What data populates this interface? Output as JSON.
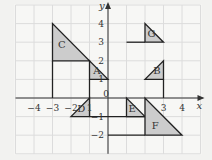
{
  "diagram": {
    "axes": {
      "x_label": "x",
      "y_label": "y",
      "x_range": [
        -5,
        5
      ],
      "y_range": [
        -3,
        5
      ],
      "x_ticks": [
        {
          "v": -4,
          "label": "−4"
        },
        {
          "v": -3,
          "label": "−3"
        },
        {
          "v": -2,
          "label": "−2"
        },
        {
          "v": -1,
          "label": "1"
        },
        {
          "v": 0,
          "label": "0"
        },
        {
          "v": 3,
          "label": "3"
        },
        {
          "v": 4,
          "label": "4"
        }
      ],
      "y_ticks": [
        {
          "v": 4,
          "label": "4"
        },
        {
          "v": 3,
          "label": "3"
        },
        {
          "v": 2,
          "label": "2"
        },
        {
          "v": 1,
          "label": "1"
        },
        {
          "v": -1,
          "label": "−1"
        },
        {
          "v": -2,
          "label": "−2"
        }
      ]
    },
    "shapes": [
      {
        "label": "A",
        "points": [
          [
            -1,
            2
          ],
          [
            -1,
            1
          ],
          [
            0,
            1
          ]
        ],
        "label_at": [
          -0.6,
          1.3
        ]
      },
      {
        "label": "B",
        "points": [
          [
            2,
            1
          ],
          [
            3,
            1
          ],
          [
            3,
            2
          ]
        ],
        "label_at": [
          2.65,
          1.3
        ]
      },
      {
        "label": "C",
        "points": [
          [
            -3,
            4
          ],
          [
            -3,
            2
          ],
          [
            -1,
            2
          ]
        ],
        "label_at": [
          -2.5,
          2.7
        ]
      },
      {
        "label": "D",
        "points": [
          [
            -2,
            -1
          ],
          [
            -1,
            -1
          ],
          [
            -1,
            0
          ]
        ],
        "label_at": [
          -1.45,
          -0.75
        ]
      },
      {
        "label": "E",
        "points": [
          [
            1,
            0
          ],
          [
            1,
            -1
          ],
          [
            2,
            -1
          ]
        ],
        "label_at": [
          1.3,
          -0.75
        ]
      },
      {
        "label": "F",
        "points": [
          [
            2,
            0
          ],
          [
            2,
            -2
          ],
          [
            4,
            -2
          ]
        ],
        "label_at": [
          2.55,
          -1.65
        ]
      },
      {
        "label": "G",
        "points": [
          [
            2,
            4
          ],
          [
            2,
            3
          ],
          [
            3,
            3
          ]
        ],
        "label_at": [
          2.35,
          3.3
        ]
      }
    ],
    "lines": [
      [
        [
          -3,
          2
        ],
        [
          -3,
          0
        ]
      ],
      [
        [
          -1,
          1
        ],
        [
          -1,
          -1
        ]
      ],
      [
        [
          -1,
          -1
        ],
        [
          2,
          -1
        ]
      ],
      [
        [
          0,
          -2
        ],
        [
          2,
          -2
        ]
      ],
      [
        [
          1,
          3
        ],
        [
          2,
          3
        ]
      ],
      [
        [
          3,
          1
        ],
        [
          3,
          0
        ]
      ]
    ],
    "colors": {
      "fill": "#cccccc",
      "stroke": "#222222",
      "grid": "#ffffff",
      "bg": "#f2f2f0"
    }
  }
}
